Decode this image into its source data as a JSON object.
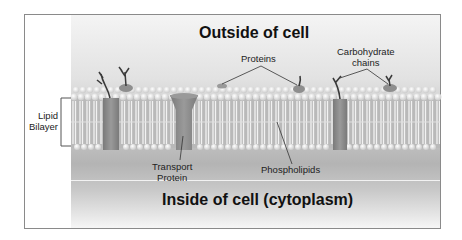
{
  "diagram": {
    "type": "cell-membrane",
    "title_outside": "Outside of cell",
    "title_inside": "Inside of cell (cytoplasm)",
    "labels": {
      "lipid_bilayer_line1": "Lipid",
      "lipid_bilayer_line2": "Bilayer",
      "proteins": "Proteins",
      "carbohydrate_line1": "Carbohydrate",
      "carbohydrate_line2": "chains",
      "transport_line1": "Transport",
      "transport_line2": "Protein",
      "phospholipids": "Phospholipids"
    },
    "colors": {
      "background_light": "#f4f4f4",
      "background_dark": "#b4b4b4",
      "phospholipid_head": "#f5f5f5",
      "protein": "#8e8e8e",
      "carbohydrate": "#3a3a3a",
      "leader_line": "#333333"
    }
  }
}
